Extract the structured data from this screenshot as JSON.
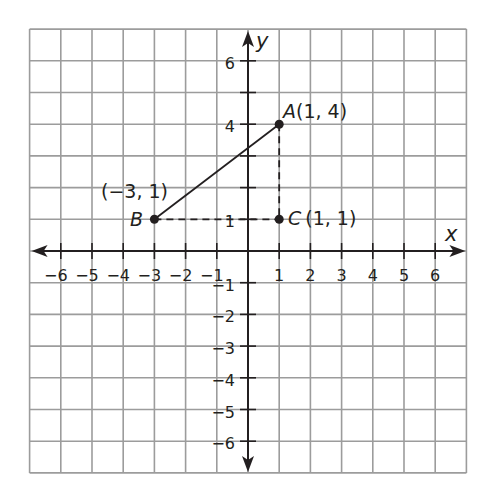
{
  "figure": {
    "type": "coordinate-plane",
    "grid": {
      "xmin": -7,
      "xmax": 7,
      "ymin": -7,
      "ymax": 7,
      "origin_px": [
        248,
        251
      ],
      "unit_px_x": 31.2,
      "unit_px_y": 31.7,
      "grid_color": "#9c9c9c",
      "axis_color": "#231f20"
    },
    "axes": {
      "x_label": "x",
      "y_label": "y",
      "x_tick_labels": [
        {
          "value": -6,
          "label": "−6"
        },
        {
          "value": -5,
          "label": "−5"
        },
        {
          "value": -4,
          "label": "−4"
        },
        {
          "value": -3,
          "label": "−3"
        },
        {
          "value": -2,
          "label": "−2"
        },
        {
          "value": -1,
          "label": "−1"
        },
        {
          "value": 1,
          "label": "1"
        },
        {
          "value": 2,
          "label": "2"
        },
        {
          "value": 3,
          "label": "3"
        },
        {
          "value": 4,
          "label": "4"
        },
        {
          "value": 5,
          "label": "5"
        },
        {
          "value": 6,
          "label": "6"
        }
      ],
      "y_tick_labels": [
        {
          "value": 6,
          "label": "6"
        },
        {
          "value": 4,
          "label": "4"
        },
        {
          "value": 1,
          "label": "1"
        },
        {
          "value": -1,
          "label": "−1"
        },
        {
          "value": -2,
          "label": "−2"
        },
        {
          "value": -3,
          "label": "−3"
        },
        {
          "value": -4,
          "label": "−4"
        },
        {
          "value": -5,
          "label": "−5"
        },
        {
          "value": -6,
          "label": "−6"
        }
      ]
    },
    "points": {
      "A": {
        "name": "A",
        "x": 1,
        "y": 4,
        "coords_label": "(1, 4)"
      },
      "B": {
        "name": "B",
        "x": -3,
        "y": 1,
        "coords_label": "(−3, 1)"
      },
      "C": {
        "name": "C",
        "x": 1,
        "y": 1,
        "coords_label": "(1, 1)"
      }
    },
    "segments": [
      {
        "from": "B",
        "to": "A",
        "style": "solid"
      },
      {
        "from": "A",
        "to": "C",
        "style": "dashed"
      },
      {
        "from": "B",
        "to": "C",
        "style": "dashed"
      }
    ]
  }
}
